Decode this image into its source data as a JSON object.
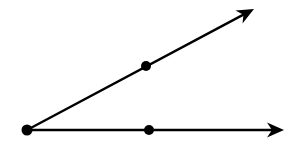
{
  "diagram": {
    "type": "angle",
    "colors": {
      "stroke": "#000000",
      "background": "#ffffff"
    },
    "vertex": {
      "x": 27,
      "y": 130
    },
    "rays": [
      {
        "name": "upper-ray",
        "from": {
          "x": 27,
          "y": 130
        },
        "to": {
          "x": 254,
          "y": 9
        },
        "point": {
          "x": 146,
          "y": 66
        }
      },
      {
        "name": "lower-ray",
        "from": {
          "x": 27,
          "y": 130
        },
        "to": {
          "x": 284,
          "y": 130
        },
        "point": {
          "x": 149,
          "y": 130
        }
      }
    ]
  }
}
